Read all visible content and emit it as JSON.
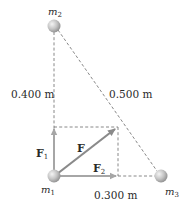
{
  "diagram": {
    "type": "physics-vector-diagram",
    "colors": {
      "dashed_line": "#6a6a6a",
      "component_arrow": "#a6a6a6",
      "resultant_arrow": "#8a8a8a",
      "sphere_light": "#f2f2f2",
      "sphere_dark": "#9a9a9a",
      "text": "#2a2a2a"
    },
    "masses": [
      {
        "id": "m1",
        "label": "m",
        "subscript": "1",
        "x": 54,
        "y": 176
      },
      {
        "id": "m2",
        "label": "m",
        "subscript": "2",
        "x": 54,
        "y": 26
      },
      {
        "id": "m3",
        "label": "m",
        "subscript": "3",
        "x": 161,
        "y": 176
      }
    ],
    "distances": {
      "m1_m2": "0.400 m",
      "m2_m3": "0.500 m",
      "m1_m3": "0.300 m"
    },
    "vectors": {
      "F1": {
        "label": "F",
        "subscript": "1",
        "direction": "up"
      },
      "F": {
        "label": "F",
        "subscript": "",
        "direction": "resultant"
      },
      "F2": {
        "label": "F",
        "subscript": "2",
        "direction": "right"
      }
    }
  }
}
